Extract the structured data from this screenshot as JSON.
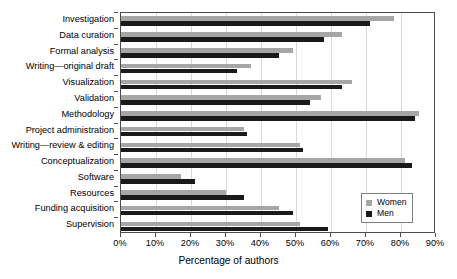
{
  "chart_data": {
    "type": "bar",
    "orientation": "horizontal",
    "title": "",
    "subtitle": "",
    "xlabel": "Percentage of authors",
    "ylabel": "",
    "xlim": [
      0,
      90
    ],
    "xticks": [
      0,
      10,
      20,
      30,
      40,
      50,
      60,
      70,
      80,
      90
    ],
    "xtick_labels": [
      "0%",
      "10%",
      "20%",
      "30%",
      "40%",
      "50%",
      "60%",
      "70%",
      "80%",
      "90%"
    ],
    "grid": true,
    "grid_axis": "x",
    "legend_position": "bottom-right",
    "categories": [
      "Investigation",
      "Data curation",
      "Formal analysis",
      "Writing—original draft",
      "Visualization",
      "Validation",
      "Methodology",
      "Project administration",
      "Writing—review & editing",
      "Conceptualization",
      "Software",
      "Resources",
      "Funding acquisition",
      "Supervision"
    ],
    "series": [
      {
        "name": "Women",
        "color": "#a6a6a6",
        "values": [
          78,
          63,
          49,
          37,
          66,
          57,
          85,
          35,
          51,
          81,
          17,
          30,
          45,
          51
        ]
      },
      {
        "name": "Men",
        "color": "#1a1a1a",
        "values": [
          71,
          58,
          45,
          33,
          63,
          54,
          84,
          36,
          52,
          83,
          21,
          35,
          49,
          59
        ]
      }
    ]
  },
  "legend": {
    "items": [
      {
        "label": "Women",
        "color": "#a6a6a6",
        "swatch": "square-swatch-women"
      },
      {
        "label": "Men",
        "color": "#1a1a1a",
        "swatch": "square-swatch-men"
      }
    ]
  }
}
